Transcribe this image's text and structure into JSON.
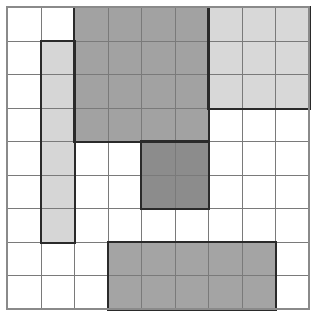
{
  "grid": {
    "rows": 9,
    "cols": 9,
    "cell_size": 33.56,
    "background": "#ffffff",
    "line_color": "#7a7a7a"
  },
  "regions": [
    {
      "name": "top-center-block",
      "row": 0,
      "col": 2,
      "rows": 4,
      "cols": 4,
      "color": "#a2a2a2"
    },
    {
      "name": "top-right-block",
      "row": 0,
      "col": 6,
      "rows": 3,
      "cols": 3,
      "color": "#d8d8d8"
    },
    {
      "name": "left-column-block",
      "row": 1,
      "col": 1,
      "rows": 6,
      "cols": 1,
      "color": "#d6d6d6"
    },
    {
      "name": "center-dark-block",
      "row": 4,
      "col": 4,
      "rows": 2,
      "cols": 2,
      "color": "#8c8c8c"
    },
    {
      "name": "bottom-block",
      "row": 7,
      "col": 3,
      "rows": 2,
      "cols": 5,
      "color": "#a4a4a4"
    }
  ]
}
